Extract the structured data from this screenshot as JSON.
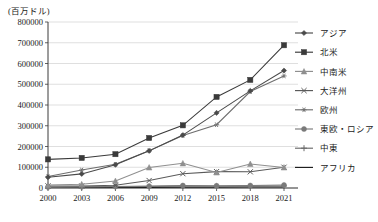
{
  "unit_label": "(百万ドル)",
  "axes": {
    "y_ticks": [
      "0",
      "100000",
      "200000",
      "300000",
      "400000",
      "500000",
      "600000",
      "700000",
      "800000"
    ],
    "x_ticks": [
      "2000",
      "2003",
      "2006",
      "2009",
      "2012",
      "2015",
      "2018",
      "2021"
    ]
  },
  "legend": {
    "items": [
      {
        "label": "アジア",
        "marker": "diamond-marker",
        "color": "#4a4a4a"
      },
      {
        "label": "北米",
        "marker": "square-marker",
        "color": "#3a3a3a"
      },
      {
        "label": "中南米",
        "marker": "triangle-marker",
        "color": "#8f8f8f"
      },
      {
        "label": "大洋州",
        "marker": "x-marker",
        "color": "#5a5a5a"
      },
      {
        "label": "欧州",
        "marker": "asterisk-marker",
        "color": "#6e6e6e"
      },
      {
        "label": "東欧・ロシア",
        "marker": "circle-marker",
        "color": "#7a7a7a"
      },
      {
        "label": "中東",
        "marker": "plus-marker",
        "color": "#6a6a6a"
      },
      {
        "label": "アフリカ",
        "marker": "line-marker",
        "color": "#1f1f1f"
      }
    ]
  },
  "chart_data": {
    "type": "line",
    "title": "",
    "xlabel": "",
    "ylabel": "(百万ドル)",
    "ylim": [
      0,
      800000
    ],
    "ytick_step": 100000,
    "grid": true,
    "legend_position": "right",
    "x": [
      "2000",
      "2003",
      "2006",
      "2009",
      "2012",
      "2015",
      "2018",
      "2021"
    ],
    "categories": [
      "2000",
      "2003",
      "2006",
      "2009",
      "2012",
      "2015",
      "2018",
      "2021"
    ],
    "series": [
      {
        "name": "アジア",
        "marker": "diamond",
        "color": "#4a4a4a",
        "values": [
          52000,
          68000,
          112000,
          179000,
          255000,
          362000,
          468000,
          566000
        ]
      },
      {
        "name": "北米",
        "marker": "square",
        "color": "#3a3a3a",
        "values": [
          138000,
          145000,
          163000,
          241000,
          302000,
          439000,
          521000,
          688000
        ]
      },
      {
        "name": "中南米",
        "marker": "triangle",
        "color": "#8f8f8f",
        "values": [
          14000,
          18000,
          34000,
          99000,
          119000,
          75000,
          116000,
          99000
        ]
      },
      {
        "name": "大洋州",
        "marker": "x",
        "color": "#5a5a5a",
        "values": [
          10000,
          10000,
          13000,
          36000,
          69000,
          79000,
          78000,
          100000
        ]
      },
      {
        "name": "欧州",
        "marker": "asterisk",
        "color": "#6e6e6e",
        "values": [
          55000,
          87000,
          114000,
          180000,
          253000,
          305000,
          465000,
          540000
        ]
      },
      {
        "name": "東欧・ロシア",
        "marker": "circle",
        "color": "#7a7a7a",
        "values": [
          5000,
          6000,
          7000,
          9000,
          12000,
          11000,
          12000,
          14000
        ]
      },
      {
        "name": "中東",
        "marker": "plus",
        "color": "#6a6a6a",
        "values": [
          4000,
          5000,
          6000,
          7000,
          9000,
          8000,
          9000,
          10000
        ]
      },
      {
        "name": "アフリカ",
        "marker": "none",
        "color": "#1f1f1f",
        "values": [
          2000,
          2000,
          3000,
          3000,
          4000,
          4000,
          5000,
          5000
        ]
      }
    ]
  }
}
